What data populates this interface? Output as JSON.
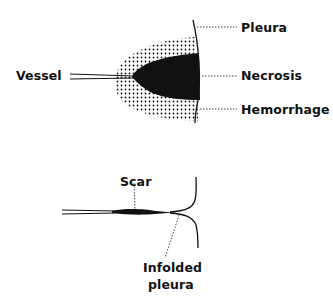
{
  "figure": {
    "top_panel": {
      "labels": {
        "vessel": "Vessel",
        "pleura": "Pleura",
        "necrosis": "Necrosis",
        "hemorrhage": "Hemorrhage"
      }
    },
    "bottom_panel": {
      "labels": {
        "scar": "Scar",
        "infolded_line1": "Infolded",
        "infolded_line2": "pleura"
      }
    },
    "colors": {
      "ink": "#111111",
      "background": "#ffffff"
    }
  }
}
